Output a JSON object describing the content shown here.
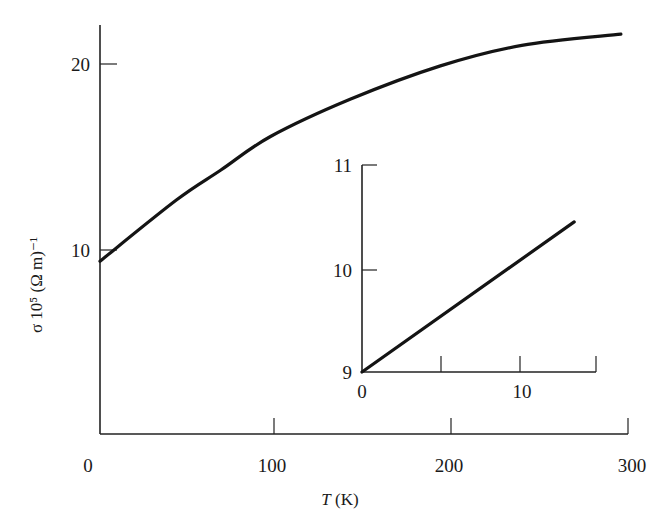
{
  "chart_data": [
    {
      "id": "main",
      "type": "line",
      "title": "",
      "xlabel": "T (K)",
      "ylabel": "σ 10⁵ (Ω m)⁻¹",
      "xlim": [
        0,
        300
      ],
      "ylim": [
        0,
        22
      ],
      "x_ticks": [
        0,
        100,
        200,
        300
      ],
      "y_ticks": [
        10,
        20
      ],
      "grid": false,
      "legend": null,
      "series": [
        {
          "name": "conductivity",
          "x": [
            2,
            45,
            70,
            98,
            143,
            194,
            240,
            296
          ],
          "y": [
            9.4,
            12.7,
            14.3,
            16.1,
            18.1,
            19.9,
            21.0,
            21.6
          ]
        }
      ]
    },
    {
      "id": "inset",
      "type": "line",
      "title": "",
      "xlabel": "",
      "ylabel": "",
      "xlim": [
        0,
        15
      ],
      "ylim": [
        9,
        11
      ],
      "x_ticks": [
        0,
        5,
        10,
        15
      ],
      "x_tick_labels": [
        "0",
        "",
        "10",
        ""
      ],
      "y_ticks": [
        9,
        10,
        11
      ],
      "grid": false,
      "legend": null,
      "series": [
        {
          "name": "low-temperature conductivity",
          "x": [
            0,
            13.6
          ],
          "y": [
            9.0,
            10.45
          ]
        }
      ]
    }
  ],
  "labels": {
    "main_x_ticks": [
      "0",
      "100",
      "200",
      "300"
    ],
    "main_y_ticks": [
      "10",
      "20"
    ],
    "inset_x_ticks": [
      "0",
      "10"
    ],
    "inset_y_ticks": [
      "9",
      "10",
      "11"
    ],
    "x_title_var": "T",
    "x_title_unit": " (K)",
    "y_title": "σ 10⁵ (Ω m)⁻¹"
  }
}
